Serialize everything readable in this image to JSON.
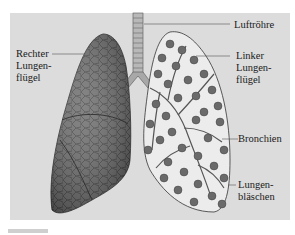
{
  "diagram": {
    "background_color": "#dcdcdc",
    "labels": {
      "rechter_lungenfluegel": [
        "Rechter",
        "Lungen-",
        "flügel"
      ],
      "luftroehre": "Luftröhre",
      "linker_lungenfluegel": [
        "Linker",
        "Lungen-",
        "flügel"
      ],
      "bronchien": "Bronchien",
      "lungenblaeschen": [
        "Lungen-",
        "bläschen"
      ]
    }
  }
}
